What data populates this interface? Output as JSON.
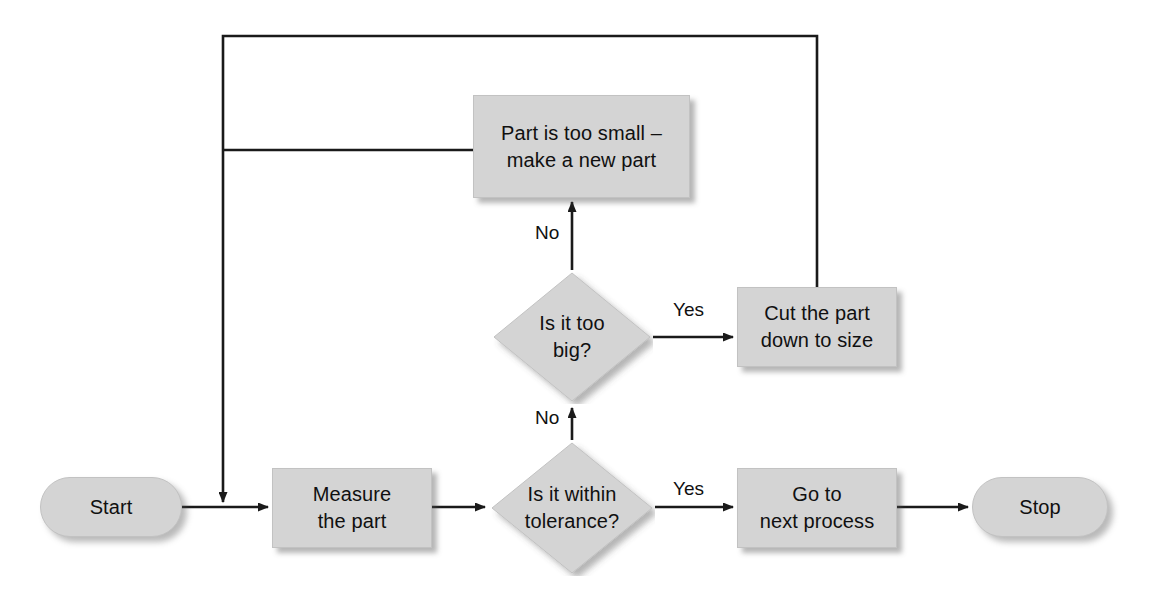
{
  "diagram": {
    "palette": {
      "shape_fill": "#d4d4d4",
      "shape_stroke": "#c2c2c2",
      "line": "#1a1a1a",
      "text": "#101010",
      "background": "#ffffff"
    },
    "nodes": [
      {
        "id": "start",
        "type": "terminator",
        "label": "Start",
        "x": 40,
        "y": 477,
        "w": 142,
        "h": 60
      },
      {
        "id": "measure",
        "type": "process",
        "label": "Measure\nthe part",
        "x": 272,
        "y": 468,
        "w": 160,
        "h": 80
      },
      {
        "id": "within",
        "type": "decision",
        "label": "Is it within\ntolerance?",
        "x": 489,
        "y": 440,
        "w": 166,
        "h": 136
      },
      {
        "id": "gonext",
        "type": "process",
        "label": "Go to\nnext process",
        "x": 737,
        "y": 468,
        "w": 160,
        "h": 80
      },
      {
        "id": "stop",
        "type": "terminator",
        "label": "Stop",
        "x": 972,
        "y": 477,
        "w": 136,
        "h": 60
      },
      {
        "id": "toobig",
        "type": "decision",
        "label": "Is it too\nbig?",
        "x": 491,
        "y": 270,
        "w": 162,
        "h": 134
      },
      {
        "id": "cut",
        "type": "process",
        "label": "Cut the part\ndown to size",
        "x": 737,
        "y": 287,
        "w": 160,
        "h": 80
      },
      {
        "id": "toosmall",
        "type": "process",
        "label": "Part is too small –\nmake a new part",
        "x": 473,
        "y": 95,
        "w": 217,
        "h": 103
      }
    ],
    "edge_labels": [
      {
        "id": "within-yes",
        "text": "Yes",
        "x": 673,
        "y": 478
      },
      {
        "id": "within-no",
        "text": "No",
        "x": 535,
        "y": 407
      },
      {
        "id": "toobig-yes",
        "text": "Yes",
        "x": 673,
        "y": 299
      },
      {
        "id": "toobig-no",
        "text": "No",
        "x": 535,
        "y": 222
      }
    ],
    "edges": [
      {
        "id": "start-to-measure",
        "from": "start",
        "to": "measure"
      },
      {
        "id": "measure-to-within",
        "from": "measure",
        "to": "within"
      },
      {
        "id": "within-yes-to-gonext",
        "from": "within",
        "to": "gonext"
      },
      {
        "id": "gonext-to-stop",
        "from": "gonext",
        "to": "stop"
      },
      {
        "id": "within-no-to-toobig",
        "from": "within",
        "to": "toobig"
      },
      {
        "id": "toobig-yes-to-cut",
        "from": "toobig",
        "to": "cut"
      },
      {
        "id": "toobig-no-to-toosmall",
        "from": "toobig",
        "to": "toosmall"
      },
      {
        "id": "cut-loop-to-measure",
        "from": "cut",
        "to": "measure"
      },
      {
        "id": "toosmall-loop-to-measure",
        "from": "toosmall",
        "to": "measure"
      }
    ]
  }
}
